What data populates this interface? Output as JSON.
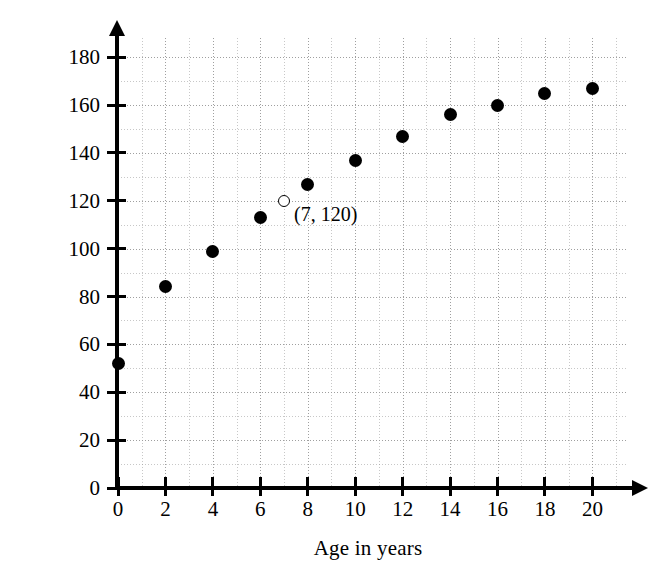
{
  "chart_data": {
    "type": "scatter",
    "title": "",
    "xlabel": "Age in years",
    "ylabel": "Average height in centimeters",
    "xlim": [
      0,
      21.5
    ],
    "ylim": [
      0,
      188
    ],
    "grid": true,
    "grid_major_x_step": 2,
    "grid_minor_x_step": 1,
    "grid_major_y_step": 20,
    "grid_minor_y_step": 10,
    "legend": "none",
    "x_ticks": [
      0,
      2,
      4,
      6,
      8,
      10,
      12,
      14,
      16,
      18,
      20
    ],
    "x_tick_labels": [
      "0",
      "2",
      "4",
      "6",
      "8",
      "10",
      "12",
      "14",
      "16",
      "18",
      "20"
    ],
    "y_ticks": [
      0,
      20,
      40,
      60,
      80,
      100,
      120,
      140,
      160,
      180
    ],
    "y_tick_labels": [
      "0",
      "20",
      "40",
      "60",
      "80",
      "100",
      "120",
      "140",
      "160",
      "180"
    ],
    "series": [
      {
        "name": "Average height by age",
        "marker": "filled-circle",
        "color": "#000000",
        "points": [
          {
            "x": 0,
            "y": 52
          },
          {
            "x": 2,
            "y": 84
          },
          {
            "x": 4,
            "y": 99
          },
          {
            "x": 6,
            "y": 113
          },
          {
            "x": 8,
            "y": 127
          },
          {
            "x": 10,
            "y": 137
          },
          {
            "x": 12,
            "y": 147
          },
          {
            "x": 14,
            "y": 156
          },
          {
            "x": 16,
            "y": 160
          },
          {
            "x": 18,
            "y": 165
          },
          {
            "x": 20,
            "y": 167
          }
        ]
      },
      {
        "name": "Highlighted point",
        "marker": "open-circle",
        "color": "#000000",
        "points": [
          {
            "x": 7,
            "y": 120
          }
        ]
      }
    ],
    "annotations": [
      {
        "text": "(7, 120)",
        "x": 7,
        "y": 120,
        "anchor": "right-of-point"
      }
    ]
  }
}
